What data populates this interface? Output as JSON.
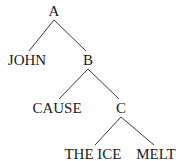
{
  "diagram": {
    "type": "tree",
    "nodes": [
      {
        "id": "A",
        "label": "A"
      },
      {
        "id": "JOHN",
        "label": "JOHN"
      },
      {
        "id": "B",
        "label": "B"
      },
      {
        "id": "CAUSE",
        "label": "CAUSE"
      },
      {
        "id": "C",
        "label": "C"
      },
      {
        "id": "THE_ICE",
        "label": "THE ICE"
      },
      {
        "id": "MELT",
        "label": "MELT"
      }
    ],
    "edges": [
      {
        "from": "A",
        "to": "JOHN"
      },
      {
        "from": "A",
        "to": "B"
      },
      {
        "from": "B",
        "to": "CAUSE"
      },
      {
        "from": "B",
        "to": "C"
      },
      {
        "from": "C",
        "to": "THE_ICE"
      },
      {
        "from": "C",
        "to": "MELT"
      }
    ]
  }
}
